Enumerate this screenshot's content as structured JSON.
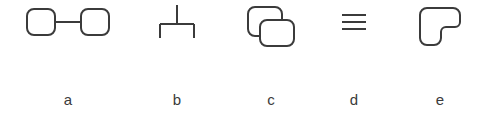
{
  "figure": {
    "background_color": "#ffffff",
    "stroke_color": "#3b3b3b",
    "label_color": "#3b3b3b",
    "stroke_width": 2,
    "panels": [
      {
        "id": "a",
        "label": "a",
        "glyph_name": "two-linked-rounded-squares",
        "description": "Two rounded squares joined by a short horizontal connector line"
      },
      {
        "id": "b",
        "label": "b",
        "glyph_name": "inverted-tee-trident",
        "description": "Vertical stem meeting a horizontal bar with two short downward legs at the ends"
      },
      {
        "id": "c",
        "label": "c",
        "glyph_name": "two-overlapping-rounded-squares",
        "description": "Two rounded squares overlapping diagonally, front one occluding the back one"
      },
      {
        "id": "d",
        "label": "d",
        "glyph_name": "three-horizontal-lines",
        "description": "Three short stacked horizontal lines"
      },
      {
        "id": "e",
        "label": "e",
        "glyph_name": "notched-rounded-square",
        "description": "Rounded square with a notch cut out of the lower-right corner"
      }
    ]
  }
}
